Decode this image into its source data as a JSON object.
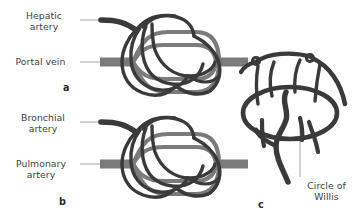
{
  "figure": {
    "background_color": "#ffffff",
    "colors": {
      "dark_vessel": "#3a3a3a",
      "light_vessel": "#7b7b7b",
      "leader_line": "#9a9a9a",
      "label_text": "#3f3f3f",
      "panel_letter": "#2b2b2b"
    }
  },
  "panels": [
    {
      "id": "a",
      "letter": "a",
      "organ": "liver",
      "labels": [
        {
          "name": "hepatic-artery",
          "text": "Hepatic\nartery",
          "vessel_color": "#3a3a3a"
        },
        {
          "name": "portal-vein",
          "text": "Portal vein",
          "vessel_color": "#7b7b7b"
        }
      ]
    },
    {
      "id": "b",
      "letter": "b",
      "organ": "lung",
      "labels": [
        {
          "name": "bronchial-artery",
          "text": "Bronchial\nartery",
          "vessel_color": "#3a3a3a"
        },
        {
          "name": "pulmonary-artery",
          "text": "Pulmonary\nartery",
          "vessel_color": "#7b7b7b"
        }
      ]
    },
    {
      "id": "c",
      "letter": "c",
      "organ": "brain",
      "labels": [
        {
          "name": "circle-of-willis",
          "text": "Circle of\nWillis",
          "vessel_color": "#3a3a3a"
        }
      ]
    }
  ],
  "annotations": {
    "hepatic_artery": "Hepatic\nartery",
    "portal_vein": "Portal vein",
    "bronchial_artery": "Bronchial\nartery",
    "pulmonary_artery": "Pulmonary\nartery",
    "circle_of_willis": "Circle of\nWillis",
    "letter_a": "a",
    "letter_b": "b",
    "letter_c": "c"
  }
}
